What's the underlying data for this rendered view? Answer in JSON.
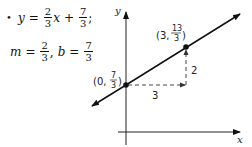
{
  "bullet": "•",
  "equation": {
    "lhs": "y",
    "equals": "=",
    "slope_num": "2",
    "slope_den": "3",
    "var": "x",
    "plus": "+",
    "int_num": "7",
    "int_den": "3",
    "trail": ";"
  },
  "params": {
    "m_label": "m",
    "equals": "=",
    "m_num": "2",
    "m_den": "3",
    "sep": ",",
    "b_label": "b",
    "b_num": "7",
    "b_den": "3"
  },
  "graph": {
    "x_axis_label": "x",
    "y_axis_label": "y",
    "point1": {
      "open": "(0, ",
      "num": "7",
      "den": "3",
      "close": ")"
    },
    "point2": {
      "open": "(3, ",
      "num": "13",
      "den": "3",
      "close": ")"
    },
    "run_label": "3",
    "rise_label": "2",
    "line_color": "#111111",
    "dash_color": "#444444"
  }
}
